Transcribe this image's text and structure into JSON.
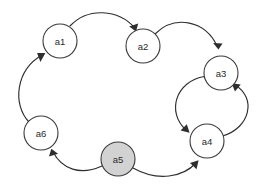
{
  "diagram": {
    "type": "directed-graph",
    "title": "",
    "background_color": "#ffffff",
    "edge_color": "#2e2e2e",
    "node_stroke_color": "#3a3a3a",
    "node_default_fill": "#ffffff",
    "node_highlight_fill": "#d2d2d2",
    "node_label_color": "#2a2a2a",
    "node_radius": 17,
    "nodes": [
      {
        "id": "a1",
        "label": "a1",
        "cx": 60,
        "cy": 41,
        "fill": "#ffffff",
        "highlighted": false
      },
      {
        "id": "a2",
        "label": "a2",
        "cx": 143,
        "cy": 46,
        "fill": "#ffffff",
        "highlighted": false
      },
      {
        "id": "a3",
        "label": "a3",
        "cx": 221,
        "cy": 73,
        "fill": "#ffffff",
        "highlighted": false
      },
      {
        "id": "a4",
        "label": "a4",
        "cx": 207,
        "cy": 141,
        "fill": "#ffffff",
        "highlighted": false
      },
      {
        "id": "a5",
        "label": "a5",
        "cx": 118,
        "cy": 159,
        "fill": "#d2d2d2",
        "highlighted": true
      },
      {
        "id": "a6",
        "label": "a6",
        "cx": 41,
        "cy": 133,
        "fill": "#ffffff",
        "highlighted": false
      }
    ],
    "edges": [
      {
        "id": "e-a1-a2",
        "from": "a1",
        "to": "a2",
        "directed": true,
        "curve": "arc-up"
      },
      {
        "id": "e-a2-a3",
        "from": "a2",
        "to": "a3",
        "directed": true,
        "curve": "arc-up"
      },
      {
        "id": "e-a3-a4",
        "from": "a3",
        "to": "a4",
        "directed": true,
        "curve": "arc-left"
      },
      {
        "id": "e-a4-a3",
        "from": "a4",
        "to": "a3",
        "directed": true,
        "curve": "arc-right"
      },
      {
        "id": "e-a5-a4",
        "from": "a5",
        "to": "a4",
        "directed": true,
        "curve": "arc-down"
      },
      {
        "id": "e-a5-a6",
        "from": "a5",
        "to": "a6",
        "directed": true,
        "curve": "arc-down"
      },
      {
        "id": "e-a6-a1",
        "from": "a6",
        "to": "a1",
        "directed": true,
        "curve": "arc-left"
      }
    ]
  }
}
